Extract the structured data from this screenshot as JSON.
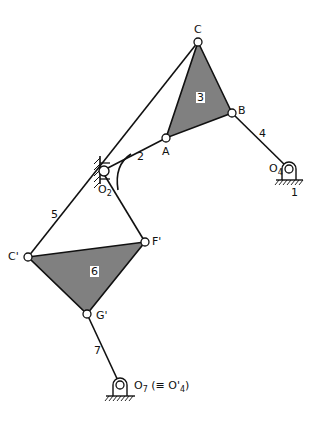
{
  "diagram": {
    "type": "linkage-mechanism",
    "colors": {
      "line": "#111111",
      "fill": "#808080",
      "background": "#ffffff"
    },
    "joints": {
      "C": "C",
      "B": "B",
      "A": "A",
      "O2": "O",
      "O2_sub": "2",
      "O4": "O",
      "O4_sub": "4",
      "C_prime": "C'",
      "F_prime": "F'",
      "G_prime": "G'",
      "O7": "O",
      "O7_sub": "7",
      "O7_note": "(≡ O'",
      "O7_note_sub": "4",
      "O7_note_end": ")"
    },
    "links": {
      "link1": "1",
      "link2": "2",
      "link3": "3",
      "link4": "4",
      "link5": "5",
      "link6": "6",
      "link7": "7"
    }
  }
}
